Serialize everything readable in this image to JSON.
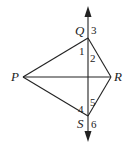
{
  "diagram": {
    "points": {
      "P": {
        "label": "P",
        "x": 23,
        "y": 77
      },
      "Q": {
        "label": "Q",
        "x": 88,
        "y": 38
      },
      "R": {
        "label": "R",
        "x": 111,
        "y": 77
      },
      "S": {
        "label": "S",
        "x": 88,
        "y": 116
      }
    },
    "segments": [
      "PQ",
      "QR",
      "RS",
      "SP",
      "PR"
    ],
    "line": {
      "through": [
        "Q",
        "S"
      ],
      "arrows": "both"
    },
    "angle_labels": [
      "1",
      "2",
      "3",
      "4",
      "5",
      "6"
    ],
    "colors": {
      "stroke": "#222222",
      "background": "#ffffff"
    }
  }
}
